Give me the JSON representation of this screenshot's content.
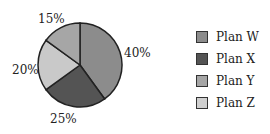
{
  "chart_data": {
    "type": "pie",
    "title": "",
    "categories": [
      "Plan W",
      "Plan X",
      "Plan Y",
      "Plan Z"
    ],
    "values": [
      40,
      25,
      20,
      15
    ],
    "labels": [
      "40%",
      "25%",
      "20%",
      "15%"
    ],
    "colors": [
      "#8c8c8c",
      "#545454",
      "#c9c9c9",
      "#a6a6a6"
    ],
    "legend_colors": [
      "#8c8c8c",
      "#545454",
      "#a6a6a6",
      "#d0d0d0"
    ],
    "legend_position": "right"
  },
  "legend": {
    "items": [
      {
        "label": "Plan W"
      },
      {
        "label": "Plan X"
      },
      {
        "label": "Plan Y"
      },
      {
        "label": "Plan Z"
      }
    ]
  },
  "slice_labels": {
    "w": "40%",
    "x": "25%",
    "y": "20%",
    "z": "15%"
  }
}
